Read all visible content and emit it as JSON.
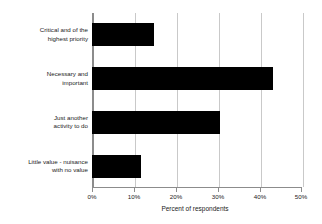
{
  "chart_data": {
    "type": "bar",
    "orientation": "horizontal",
    "title": "",
    "subtitle": "",
    "xlabel": "Percent of respondents",
    "ylabel": "",
    "categories": [
      "Critical and of the highest priority",
      "Necessary and important",
      "Just another activity to do",
      "Little value - nuisance with no value"
    ],
    "category_lines": [
      [
        "Critical and of the",
        "highest priority"
      ],
      [
        "Necessary and",
        "important"
      ],
      [
        "Just another",
        "activity to do"
      ],
      [
        "Little value - nuisance",
        "with no value"
      ]
    ],
    "values": [
      14.2,
      42.5,
      30.0,
      11.2
    ],
    "xlim": [
      0,
      50
    ],
    "xticks": [
      0,
      10,
      20,
      30,
      40,
      50
    ],
    "xtick_labels": [
      "0%",
      "10%",
      "20%",
      "30%",
      "40%",
      "50%"
    ],
    "grid": true,
    "grid_axis": "x",
    "legend": false,
    "bar_color": "#000000",
    "grid_color": "#c9c9c9",
    "axis_color": "#8c8c8c",
    "background_color": "#ffffff"
  }
}
